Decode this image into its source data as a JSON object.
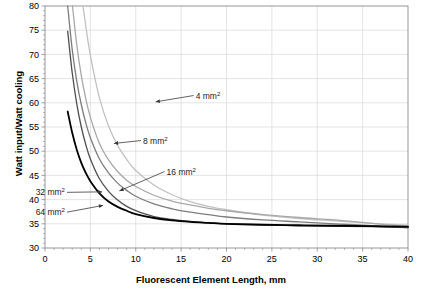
{
  "chart_data": {
    "type": "line",
    "title": "",
    "xlabel": "Fluorescent Element Length, mm",
    "ylabel": "Watt input/Watt cooling",
    "xlim": [
      0,
      40
    ],
    "ylim": [
      30,
      80
    ],
    "xticks": [
      "0",
      "5",
      "10",
      "15",
      "20",
      "25",
      "30",
      "35",
      "40"
    ],
    "yticks": [
      "30",
      "35",
      "40",
      "45",
      "50",
      "55",
      "60",
      "65",
      "70",
      "75",
      "80"
    ],
    "grid": true,
    "legend_position": "inline-annotations",
    "x": [
      2.5,
      3,
      3.5,
      4,
      4.5,
      5,
      6,
      7,
      8,
      9,
      10,
      12,
      14,
      16,
      18,
      20,
      24,
      28,
      32,
      36,
      40
    ],
    "series": [
      {
        "name": "4 mm2",
        "label": "4 mm",
        "superscript": "2",
        "color": "#c2c2c2",
        "annotation_x": 16.6,
        "annotation_y": 61.5,
        "arrow_to_x": 12.2,
        "arrow_to_y": 60.2,
        "values": [
          null,
          null,
          null,
          82.5,
          75.8,
          69.8,
          61.0,
          55.2,
          51.2,
          48.3,
          46.0,
          43.0,
          41.0,
          39.6,
          38.6,
          37.9,
          36.8,
          36.1,
          35.6,
          35.1,
          34.7
        ]
      },
      {
        "name": "8 mm2",
        "label": "8 mm",
        "superscript": "2",
        "color": "#a8a8a8",
        "annotation_x": 10.8,
        "annotation_y": 52.2,
        "arrow_to_x": 7.6,
        "arrow_to_y": 51.6,
        "values": [
          null,
          80.5,
          72.0,
          65.6,
          60.8,
          57.0,
          51.6,
          48.2,
          45.8,
          44.0,
          42.7,
          40.9,
          39.7,
          38.9,
          38.2,
          37.7,
          36.9,
          36.3,
          35.8,
          35.1,
          34.4
        ]
      },
      {
        "name": "16 mm2",
        "label": "16 mm",
        "superscript": "2",
        "color": "#7d7d7d",
        "annotation_x": 13.4,
        "annotation_y": 45.8,
        "arrow_to_x": 8.2,
        "arrow_to_y": 41.8,
        "values": [
          80.0,
          71.0,
          64.5,
          59.6,
          55.8,
          52.8,
          48.4,
          45.5,
          43.4,
          41.9,
          40.7,
          39.1,
          38.1,
          37.4,
          36.9,
          36.4,
          35.8,
          35.4,
          35.0,
          34.6,
          34.2
        ]
      },
      {
        "name": "32 mm2",
        "label": "32 mm",
        "superscript": "2",
        "color": "#4f4f4f",
        "annotation_x": 2.2,
        "annotation_y": 41.5,
        "arrow_to_x": 6.3,
        "arrow_to_y": 41.6,
        "values": [
          74.8,
          66.2,
          59.8,
          55.0,
          51.3,
          48.4,
          44.3,
          41.7,
          39.9,
          38.6,
          37.7,
          36.5,
          35.9,
          35.5,
          35.2,
          35.0,
          34.8,
          34.6,
          34.5,
          34.4,
          34.2
        ]
      },
      {
        "name": "64 mm2",
        "label": "64 mm",
        "superscript": "2",
        "color": "#000000",
        "annotation_x": 2.2,
        "annotation_y": 37.4,
        "arrow_to_x": 6.4,
        "arrow_to_y": 38.8,
        "values": [
          58.2,
          53.8,
          50.3,
          47.6,
          45.5,
          43.8,
          41.3,
          39.6,
          38.5,
          37.7,
          37.0,
          36.2,
          35.7,
          35.4,
          35.2,
          35.0,
          34.8,
          34.7,
          34.6,
          34.5,
          34.4
        ]
      }
    ]
  },
  "axes": {
    "axis_color": "#8c8c8c",
    "grid_color": "#d9d9d9",
    "plot_bg": "#ffffff"
  }
}
